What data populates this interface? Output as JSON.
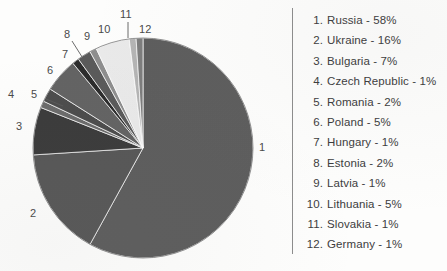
{
  "chart_data": {
    "type": "pie",
    "title": "",
    "xlabel": "",
    "ylabel": "",
    "legend_position": "right",
    "grid": false,
    "categories": [
      "Russia",
      "Ukraine",
      "Bulgaria",
      "Czech Republic",
      "Romania",
      "Poland",
      "Hungary",
      "Estonia",
      "Latvia",
      "Lithuania",
      "Slovakia",
      "Germany"
    ],
    "values": [
      58,
      16,
      7,
      1,
      2,
      5,
      1,
      2,
      1,
      5,
      1,
      1
    ],
    "units": "percent",
    "total": 100,
    "slice_colors": [
      "#5d5d5d",
      "#575757",
      "#3b3b3b",
      "#6b6b6b",
      "#4c4c4c",
      "#636363",
      "#2c2c2c",
      "#5a5a5a",
      "#8e8e8e",
      "#e9e9e9",
      "#b4b4b4",
      "#7d7d7d"
    ],
    "start_angle_deg": -90,
    "direction": "clockwise"
  },
  "pie_labels": [
    {
      "id": "pie-label-1",
      "text": "1",
      "left": 259,
      "top": 141,
      "leader": false
    },
    {
      "id": "pie-label-2",
      "text": "2",
      "left": 30,
      "top": 207,
      "leader": false
    },
    {
      "id": "pie-label-3",
      "text": "3",
      "left": 16,
      "top": 120,
      "leader": false
    },
    {
      "id": "pie-label-4",
      "text": "4",
      "left": 8,
      "top": 88,
      "leader": false
    },
    {
      "id": "pie-label-5",
      "text": "5",
      "left": 31,
      "top": 88,
      "leader": true
    },
    {
      "id": "pie-label-6",
      "text": "6",
      "left": 47,
      "top": 64,
      "leader": false
    },
    {
      "id": "pie-label-7",
      "text": "7",
      "left": 62,
      "top": 48,
      "leader": false
    },
    {
      "id": "pie-label-8",
      "text": "8",
      "left": 64,
      "top": 28,
      "leader": true
    },
    {
      "id": "pie-label-9",
      "text": "9",
      "left": 84,
      "top": 30,
      "leader": false
    },
    {
      "id": "pie-label-10",
      "text": "10",
      "left": 98,
      "top": 23,
      "leader": false
    },
    {
      "id": "pie-label-11",
      "text": "11",
      "left": 120,
      "top": 8,
      "leader": true
    },
    {
      "id": "pie-label-12",
      "text": "12",
      "left": 139,
      "top": 23,
      "leader": false
    }
  ],
  "legend": {
    "items": [
      {
        "index": "1.",
        "text": "Russia - 58%"
      },
      {
        "index": "2.",
        "text": "Ukraine - 16%"
      },
      {
        "index": "3.",
        "text": "Bulgaria - 7%"
      },
      {
        "index": "4.",
        "text": "Czech Republic - 1%"
      },
      {
        "index": "5.",
        "text": "Romania - 2%"
      },
      {
        "index": "6.",
        "text": "Poland - 5%"
      },
      {
        "index": "7.",
        "text": "Hungary - 1%"
      },
      {
        "index": "8.",
        "text": "Estonia - 2%"
      },
      {
        "index": "9.",
        "text": "Latvia - 1%"
      },
      {
        "index": "10.",
        "text": "Lithuania - 5%"
      },
      {
        "index": "11.",
        "text": "Slovakia - 1%"
      },
      {
        "index": "12.",
        "text": "Germany - 1%"
      }
    ]
  },
  "geometry": {
    "center_x": 143,
    "center_y": 148,
    "radius": 110
  }
}
